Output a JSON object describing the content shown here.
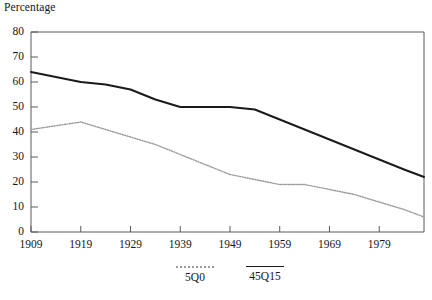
{
  "axis_title": "Percentage",
  "legend": [
    {
      "name": "series-5q0",
      "label": "5Q0",
      "style": "dotted",
      "color": "#9a9a9a",
      "x": 155
    },
    {
      "name": "series-45q15",
      "label": "45Q15",
      "style": "solid",
      "color": "#1a1a1a",
      "x": 225
    }
  ],
  "chart_data": {
    "type": "line",
    "title": "Percentage",
    "xlabel": "",
    "ylabel": "Percentage",
    "xlim": [
      1909,
      1988
    ],
    "ylim": [
      0,
      80
    ],
    "ytick_labels": [
      "0",
      "10",
      "20",
      "30",
      "40",
      "50",
      "60",
      "70",
      "80"
    ],
    "yticks": [
      0,
      10,
      20,
      30,
      40,
      50,
      60,
      70,
      80
    ],
    "xtick_labels": [
      "1909",
      "1919",
      "1929",
      "1939",
      "1949",
      "1959",
      "1969",
      "1979"
    ],
    "xticks": [
      1909,
      1919,
      1929,
      1939,
      1949,
      1959,
      1969,
      1979
    ],
    "grid": false,
    "legend_position": "below",
    "series": [
      {
        "name": "45Q15",
        "color": "#1a1a1a",
        "style": "solid",
        "x": [
          1909,
          1914,
          1919,
          1924,
          1929,
          1934,
          1939,
          1944,
          1949,
          1954,
          1959,
          1964,
          1969,
          1974,
          1979,
          1984,
          1988
        ],
        "values": [
          64,
          62,
          60,
          59,
          57,
          53,
          50,
          50,
          50,
          49,
          45,
          41,
          37,
          33,
          29,
          25,
          22
        ]
      },
      {
        "name": "5Q0",
        "color": "#9a9a9a",
        "style": "dotted",
        "x": [
          1909,
          1914,
          1919,
          1924,
          1929,
          1934,
          1939,
          1944,
          1949,
          1954,
          1959,
          1964,
          1969,
          1974,
          1979,
          1984,
          1988
        ],
        "values": [
          41,
          42.5,
          44,
          41,
          38,
          35,
          31,
          27,
          23,
          21,
          19,
          19,
          17,
          15,
          12,
          9,
          6
        ]
      }
    ]
  }
}
